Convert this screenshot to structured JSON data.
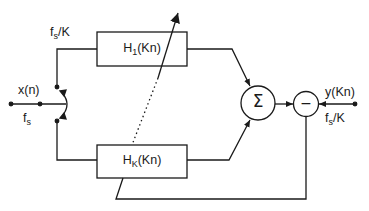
{
  "diagram": {
    "type": "adaptive filter bank block diagram",
    "input": {
      "signal_label": "x(n)",
      "rate_label_main": "f",
      "rate_label_sub": "s"
    },
    "upper_branch": {
      "rate_label_main": "f",
      "rate_label_sub": "s",
      "rate_label_suffix": "/K"
    },
    "filters": [
      {
        "name_main": "H",
        "name_sub": "1",
        "name_suffix": "(Kn)"
      },
      {
        "name_main": "H",
        "name_sub": "K",
        "name_suffix": "(Kn)"
      }
    ],
    "summer": {
      "symbol": "Σ"
    },
    "subtractor": {
      "symbol": "−"
    },
    "output": {
      "signal_label": "y(Kn)",
      "rate_label_main": "f",
      "rate_label_sub": "s",
      "rate_label_suffix": "/K"
    },
    "colors": {
      "stroke": "#1a1a1a",
      "background": "#ffffff"
    }
  }
}
